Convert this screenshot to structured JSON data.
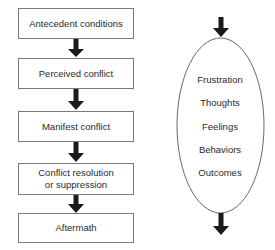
{
  "diagram": {
    "type": "flowchart",
    "left_process": {
      "stages": [
        {
          "label_lines": [
            "Antecedent conditions"
          ]
        },
        {
          "label_lines": [
            "Perceived conflict"
          ]
        },
        {
          "label_lines": [
            "Manifest conflict"
          ]
        },
        {
          "label_lines": [
            "Conflict resolution",
            "or suppression"
          ]
        },
        {
          "label_lines": [
            "Aftermath"
          ]
        }
      ],
      "connector": "down-arrow"
    },
    "right_process": {
      "shape": "ellipse",
      "items": [
        "Frustration",
        "Thoughts",
        "Feelings",
        "Behaviors",
        "Outcomes"
      ],
      "entry_arrow": "down-arrow",
      "exit_arrow": "down-arrow"
    },
    "colors": {
      "box_border": "#7a7a7a",
      "arrow_fill": "#1a1a1a",
      "text": "#2a2a2a",
      "ellipse_stroke": "#6a6a6a"
    }
  }
}
